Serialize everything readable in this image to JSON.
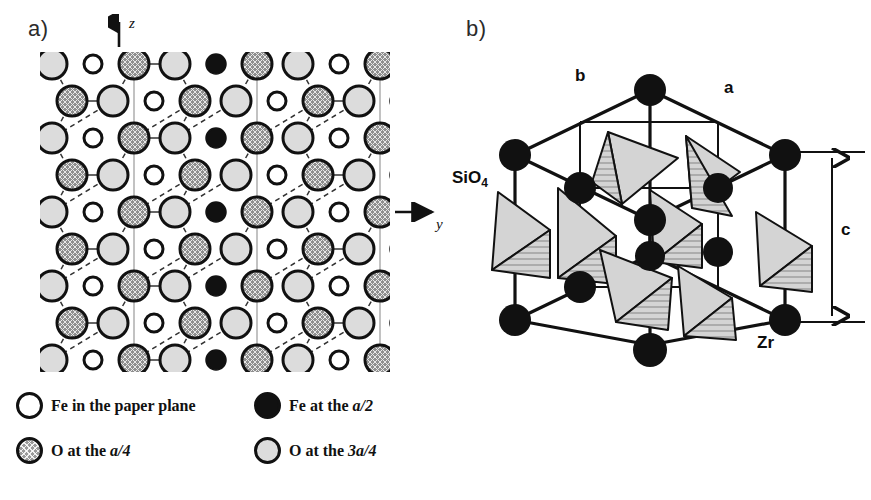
{
  "figure": {
    "panels": [
      {
        "id": "a",
        "label": "a)",
        "kind": "atomic-lattice-projection"
      },
      {
        "id": "b",
        "label": "b)",
        "kind": "unit-cell-3d"
      }
    ]
  },
  "panel_a": {
    "label": "a)",
    "axes": [
      {
        "name": "z-axis",
        "label": "z",
        "direction": "up"
      },
      {
        "name": "y-axis",
        "label": "y",
        "direction": "right"
      }
    ],
    "lattice": {
      "rows": 9,
      "cols": 9,
      "col_spacing": 41,
      "row_spacing": 37,
      "row_offset": 20,
      "radius_large": 15,
      "radius_small": 9,
      "types": [
        "o-3a4",
        "fe-plane",
        "o-a4",
        "o-3a4",
        "fe-a2",
        "o-a4",
        "o-3a4",
        "fe-plane",
        "o-a4"
      ]
    }
  },
  "panel_b": {
    "label": "b)",
    "labels": {
      "axis_b": "b",
      "axis_a": "a",
      "axis_c": "c",
      "tetrahedra": "SiO",
      "tetrahedra_sub": "4",
      "atom": "Zr"
    },
    "atom_color": "#111111",
    "tetra_fill": "#d4d4d4"
  },
  "legend": {
    "items": [
      {
        "symbol": "open-circle",
        "text_prefix": "Fe in the paper plane",
        "text_italic": "",
        "text_suffix": ""
      },
      {
        "symbol": "filled-circle",
        "text_prefix": "Fe at the ",
        "text_italic": "a/2",
        "text_suffix": ""
      },
      {
        "symbol": "hatched-circle",
        "text_prefix": "O at the ",
        "text_italic": "a/4",
        "text_suffix": ""
      },
      {
        "symbol": "light-circle",
        "text_prefix": "O at the ",
        "text_italic": "3a/4",
        "text_suffix": ""
      }
    ],
    "colors": {
      "open": "#ffffff",
      "filled": "#111111",
      "hatched": "#9a9a9a",
      "light": "#dcdcdc",
      "outline": "#111111"
    }
  }
}
